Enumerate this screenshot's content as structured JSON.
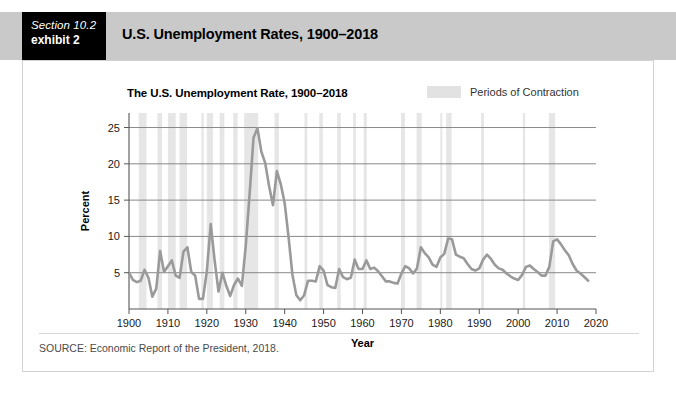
{
  "header": {
    "section_label": "Section 10.2",
    "exhibit_label": "exhibit 2",
    "title": "U.S. Unemployment Rates, 1900–2018",
    "bar_color": "#c9c9c9",
    "tag_color": "#000000"
  },
  "chart_header": {
    "title": "The U.S. Unemployment Rate, 1900–2018",
    "legend_label": "Periods of Contraction",
    "legend_swatch_color": "#e2e2e2"
  },
  "source": {
    "text": "SOURCE: Economic Report of the President, 2018."
  },
  "chart_data": {
    "type": "line",
    "title": "The U.S. Unemployment Rate, 1900–2018",
    "xlabel": "Year",
    "ylabel": "Percent",
    "xlim": [
      1900,
      2020
    ],
    "ylim": [
      0,
      27
    ],
    "xticks": [
      1900,
      1910,
      1920,
      1930,
      1940,
      1950,
      1960,
      1970,
      1980,
      1990,
      2000,
      2010,
      2020
    ],
    "yticks": [
      5,
      10,
      15,
      20,
      25
    ],
    "grid": "horizontal",
    "legend_position": "top-right",
    "line_color": "#9a9a9a",
    "line_width": 2.6,
    "series": [
      {
        "name": "U.S. Unemployment Rate",
        "x": [
          1900,
          1901,
          1902,
          1903,
          1904,
          1905,
          1906,
          1907,
          1908,
          1909,
          1910,
          1911,
          1912,
          1913,
          1914,
          1915,
          1916,
          1917,
          1918,
          1919,
          1920,
          1921,
          1922,
          1923,
          1924,
          1925,
          1926,
          1927,
          1928,
          1929,
          1930,
          1931,
          1932,
          1933,
          1934,
          1935,
          1936,
          1937,
          1938,
          1939,
          1940,
          1941,
          1942,
          1943,
          1944,
          1945,
          1946,
          1947,
          1948,
          1949,
          1950,
          1951,
          1952,
          1953,
          1954,
          1955,
          1956,
          1957,
          1958,
          1959,
          1960,
          1961,
          1962,
          1963,
          1964,
          1965,
          1966,
          1967,
          1968,
          1969,
          1970,
          1971,
          1972,
          1973,
          1974,
          1975,
          1976,
          1977,
          1978,
          1979,
          1980,
          1981,
          1982,
          1983,
          1984,
          1985,
          1986,
          1987,
          1988,
          1989,
          1990,
          1991,
          1992,
          1993,
          1994,
          1995,
          1996,
          1997,
          1998,
          1999,
          2000,
          2001,
          2002,
          2003,
          2004,
          2005,
          2006,
          2007,
          2008,
          2009,
          2010,
          2011,
          2012,
          2013,
          2014,
          2015,
          2016,
          2017,
          2018
        ],
        "values": [
          5.0,
          4.0,
          3.7,
          3.9,
          5.4,
          4.3,
          1.7,
          2.8,
          8.0,
          5.1,
          5.9,
          6.7,
          4.6,
          4.3,
          7.9,
          8.5,
          5.1,
          4.6,
          1.4,
          1.4,
          5.2,
          11.7,
          6.7,
          2.4,
          5.0,
          3.2,
          1.8,
          3.3,
          4.2,
          3.2,
          8.7,
          15.9,
          23.6,
          24.9,
          21.7,
          20.1,
          16.9,
          14.3,
          19.0,
          17.2,
          14.6,
          9.9,
          4.7,
          1.9,
          1.2,
          1.9,
          3.9,
          3.9,
          3.8,
          5.9,
          5.3,
          3.3,
          3.0,
          2.9,
          5.5,
          4.4,
          4.1,
          4.3,
          6.8,
          5.5,
          5.5,
          6.7,
          5.5,
          5.7,
          5.2,
          4.5,
          3.8,
          3.8,
          3.6,
          3.5,
          4.9,
          5.9,
          5.6,
          4.9,
          5.6,
          8.5,
          7.7,
          7.1,
          6.1,
          5.8,
          7.1,
          7.6,
          9.7,
          9.6,
          7.5,
          7.2,
          7.0,
          6.2,
          5.5,
          5.3,
          5.6,
          6.8,
          7.5,
          6.9,
          6.1,
          5.6,
          5.4,
          4.9,
          4.5,
          4.2,
          4.0,
          4.7,
          5.8,
          6.0,
          5.5,
          5.1,
          4.6,
          4.6,
          5.8,
          9.3,
          9.6,
          8.9,
          8.1,
          7.4,
          6.2,
          5.3,
          4.9,
          4.4,
          3.9
        ]
      }
    ],
    "contraction_bands": [
      {
        "start": 1902.5,
        "end": 1904.5
      },
      {
        "start": 1907.3,
        "end": 1908.5
      },
      {
        "start": 1910.0,
        "end": 1912.0
      },
      {
        "start": 1913.0,
        "end": 1914.9
      },
      {
        "start": 1918.6,
        "end": 1919.2
      },
      {
        "start": 1920.0,
        "end": 1921.6
      },
      {
        "start": 1923.3,
        "end": 1924.5
      },
      {
        "start": 1926.8,
        "end": 1927.9
      },
      {
        "start": 1929.6,
        "end": 1933.2
      },
      {
        "start": 1937.4,
        "end": 1938.5
      },
      {
        "start": 1945.1,
        "end": 1945.8
      },
      {
        "start": 1948.9,
        "end": 1949.8
      },
      {
        "start": 1953.5,
        "end": 1954.4
      },
      {
        "start": 1957.6,
        "end": 1958.3
      },
      {
        "start": 1960.3,
        "end": 1961.1
      },
      {
        "start": 1969.9,
        "end": 1970.9
      },
      {
        "start": 1973.9,
        "end": 1975.2
      },
      {
        "start": 1980.0,
        "end": 1980.5
      },
      {
        "start": 1981.5,
        "end": 1982.9
      },
      {
        "start": 1990.5,
        "end": 1991.2
      },
      {
        "start": 2001.2,
        "end": 2001.8
      },
      {
        "start": 2007.9,
        "end": 2009.5
      }
    ],
    "band_color": "#e6e6e6",
    "annotations": [
      {
        "label": "Great Depression peak",
        "x": 1933,
        "y": 24.9
      },
      {
        "label": "WWII trough",
        "x": 1944,
        "y": 1.2
      },
      {
        "label": "1982 recession peak",
        "x": 1982,
        "y": 9.7
      },
      {
        "label": "Great Recession peak",
        "x": 2010,
        "y": 9.6
      }
    ]
  }
}
